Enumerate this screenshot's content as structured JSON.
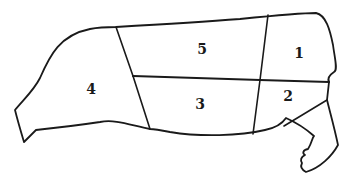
{
  "diagram": {
    "line_color": "#1a1a1a",
    "background": "#ffffff",
    "regions": [
      {
        "id": "1",
        "label": "1",
        "x": 299,
        "y": 54
      },
      {
        "id": "2",
        "label": "2",
        "x": 288,
        "y": 97
      },
      {
        "id": "3",
        "label": "3",
        "x": 200,
        "y": 105
      },
      {
        "id": "4",
        "label": "4",
        "x": 91,
        "y": 90
      },
      {
        "id": "5",
        "label": "5",
        "x": 202,
        "y": 50
      }
    ]
  }
}
